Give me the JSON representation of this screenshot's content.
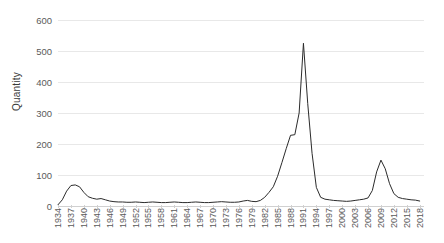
{
  "chart_data": {
    "type": "line",
    "title": "",
    "xlabel": "",
    "ylabel": "Quantity",
    "ylim": [
      0,
      600
    ],
    "ytick_values": [
      0,
      100,
      200,
      300,
      400,
      500,
      600
    ],
    "ytick_labels": [
      "0",
      "100",
      "200",
      "300",
      "400",
      "500",
      "600"
    ],
    "xlim": [
      1934,
      2019
    ],
    "xtick_labels": [
      "1934",
      "1937",
      "1940",
      "1943",
      "1946",
      "1949",
      "1952",
      "1955",
      "1958",
      "1961",
      "1964",
      "1967",
      "1970",
      "1973",
      "1976",
      "1979",
      "1982",
      "1985",
      "1988",
      "1991",
      "1994",
      "1997",
      "2000",
      "2003",
      "2006",
      "2009",
      "2012",
      "2015",
      "2018"
    ],
    "grid": "horizontal",
    "legend": "none",
    "line_color": "#2b2b2b",
    "grid_color": "#e8e8e8",
    "axis_color": "#d0d0d0",
    "text_color": "#5a5a5a",
    "background_color": "#ffffff",
    "series": [
      {
        "name": "Quantity",
        "x": [
          1934,
          1935,
          1936,
          1937,
          1938,
          1939,
          1940,
          1941,
          1942,
          1943,
          1944,
          1945,
          1946,
          1947,
          1948,
          1949,
          1950,
          1951,
          1952,
          1953,
          1954,
          1955,
          1956,
          1957,
          1958,
          1959,
          1960,
          1961,
          1962,
          1963,
          1964,
          1965,
          1966,
          1967,
          1968,
          1969,
          1970,
          1971,
          1972,
          1973,
          1974,
          1975,
          1976,
          1977,
          1978,
          1979,
          1980,
          1981,
          1982,
          1983,
          1984,
          1985,
          1986,
          1987,
          1988,
          1989,
          1990,
          1991,
          1992,
          1993,
          1994,
          1995,
          1996,
          1997,
          1998,
          1999,
          2000,
          2001,
          2002,
          2003,
          2004,
          2005,
          2006,
          2007,
          2008,
          2009,
          2010,
          2011,
          2012,
          2013,
          2014,
          2015,
          2016,
          2017,
          2018
        ],
        "values": [
          4,
          20,
          48,
          66,
          68,
          62,
          44,
          30,
          25,
          22,
          24,
          20,
          16,
          14,
          13,
          13,
          12,
          12,
          13,
          12,
          11,
          12,
          13,
          12,
          11,
          11,
          12,
          13,
          12,
          11,
          11,
          12,
          13,
          12,
          11,
          11,
          12,
          13,
          14,
          13,
          12,
          12,
          13,
          16,
          18,
          15,
          14,
          18,
          28,
          44,
          62,
          96,
          140,
          185,
          228,
          230,
          300,
          525,
          330,
          170,
          60,
          28,
          22,
          20,
          18,
          17,
          16,
          15,
          16,
          18,
          20,
          22,
          26,
          50,
          110,
          148,
          120,
          72,
          40,
          28,
          24,
          22,
          20,
          19,
          16
        ]
      }
    ]
  }
}
